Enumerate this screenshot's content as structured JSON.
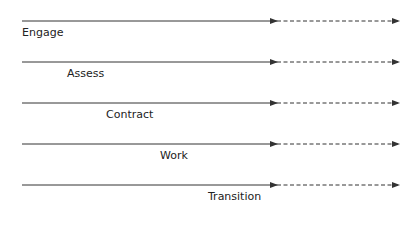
{
  "diagram": {
    "rows": [
      {
        "label": "Engage",
        "y": 21,
        "label_x": 22
      },
      {
        "label": "Assess",
        "y": 62,
        "label_x": 67
      },
      {
        "label": "Contract",
        "y": 103,
        "label_x": 106
      },
      {
        "label": "Work",
        "y": 144,
        "label_x": 160
      },
      {
        "label": "Transition",
        "y": 185,
        "label_x": 208
      }
    ],
    "line": {
      "x_start": 22,
      "x_mid": 277,
      "x_end": 399,
      "color": "#333333"
    }
  }
}
